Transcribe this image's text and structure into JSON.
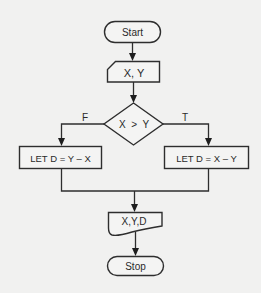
{
  "flowchart": {
    "start": {
      "label": "Start"
    },
    "input": {
      "label": "X, Y"
    },
    "decision": {
      "label": "X  >  Y",
      "false_label": "F",
      "true_label": "T"
    },
    "false_process": {
      "label": "LET D = Y – X"
    },
    "true_process": {
      "label": "LET D = X – Y"
    },
    "output": {
      "label": "X,Y,D"
    },
    "stop": {
      "label": "Stop"
    }
  },
  "colors": {
    "background": "#f1f1f0",
    "stroke": "#2e2e2e"
  }
}
